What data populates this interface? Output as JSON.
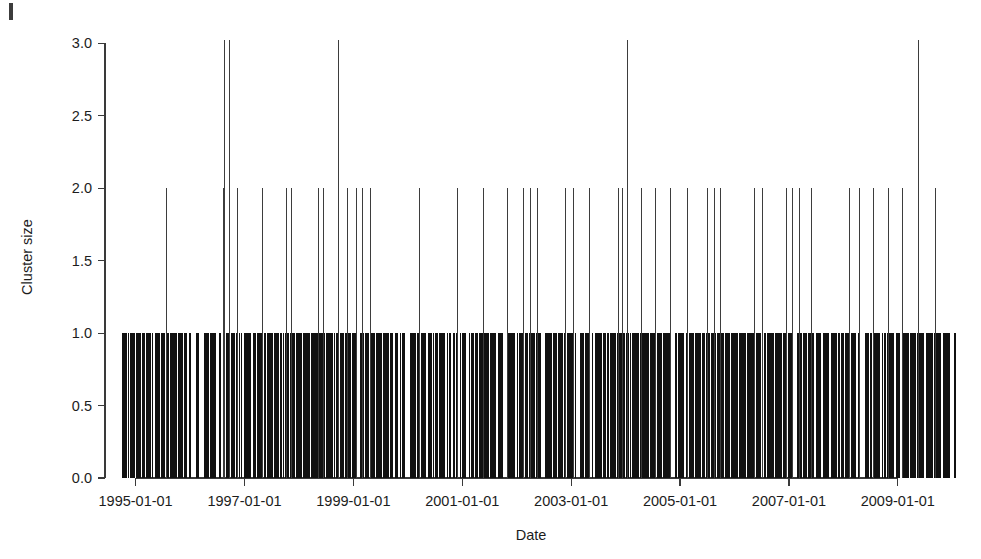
{
  "figure": {
    "background_color": "#ffffff",
    "ink_color": "#111111",
    "artifact_label": "scan-artifact-mark"
  },
  "chart_data": {
    "type": "bar",
    "title": "",
    "subtitle": "",
    "xlabel": "Date",
    "ylabel": "Cluster size",
    "grid": false,
    "legend": null,
    "x_type": "date",
    "x_tick_labels": [
      "1995-01-01",
      "1997-01-01",
      "1999-01-01",
      "2001-01-01",
      "2003-01-01",
      "2005-01-01",
      "2007-01-01",
      "2009-01-01"
    ],
    "x_tick_values": [
      1995.0,
      1997.0,
      1999.0,
      2001.0,
      2003.0,
      2005.0,
      2007.0,
      2009.0
    ],
    "y_tick_labels": [
      "0.0",
      "0.5",
      "1.0",
      "1.5",
      "2.0",
      "2.5",
      "3.0"
    ],
    "y_tick_values": [
      0.0,
      0.5,
      1.0,
      1.5,
      2.0,
      2.5,
      3.0
    ],
    "xlim": [
      1994.75,
      2010.05
    ],
    "ylim": [
      0.0,
      3.05
    ],
    "series": [
      {
        "name": "Cluster size 3",
        "value": 3,
        "x": [
          1996.62,
          1996.72,
          1998.72,
          2004.02,
          2009.37
        ]
      },
      {
        "name": "Cluster size 2",
        "value": 2,
        "x": [
          1995.55,
          1996.6,
          1996.72,
          1996.87,
          1997.32,
          1997.76,
          1997.85,
          1998.35,
          1998.44,
          1998.72,
          1998.88,
          1999.04,
          1999.16,
          1999.3,
          2000.2,
          2000.91,
          2001.38,
          2001.82,
          2002.12,
          2002.24,
          2002.37,
          2002.88,
          2003.03,
          2003.32,
          2003.86,
          2003.93,
          2004.02,
          2004.28,
          2004.54,
          2004.82,
          2005.12,
          2005.5,
          2005.62,
          2005.74,
          2006.36,
          2006.5,
          2006.95,
          2007.06,
          2007.18,
          2007.4,
          2008.1,
          2008.28,
          2008.55,
          2008.82,
          2009.08,
          2009.37,
          2009.68
        ]
      },
      {
        "name": "Cluster size 1",
        "value": 1,
        "note": "Dense near-continuous band of size-1 clusters spanning 1995-01-01 through late 2009."
      }
    ]
  },
  "axes": {
    "y_axis_label": "Cluster size",
    "x_axis_label": "Date"
  }
}
